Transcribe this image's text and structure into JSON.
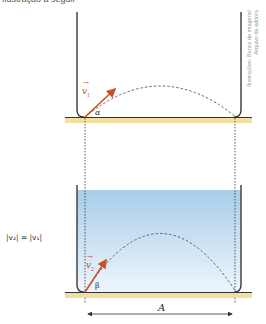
{
  "top_cut_text": "Ilustração a seguir",
  "credit": {
    "line1": "Ilustrações: Banco de imagens/",
    "line2": "Arquivo da editora"
  },
  "top_panel": {
    "vector_label": "v",
    "vector_sub": "1",
    "angle_label": "α"
  },
  "bottom_panel": {
    "vector_label": "v",
    "vector_sub": "2",
    "angle_label": "β",
    "range_label": "A"
  },
  "equation": "|v₂| = |v₁|",
  "colors": {
    "wall": "#3a3a3a",
    "floor": "#f3dfa0",
    "vector": "#c8502a",
    "water_top": "#a8cdea",
    "water_bottom": "#eaf4fc",
    "path": "#555555"
  }
}
